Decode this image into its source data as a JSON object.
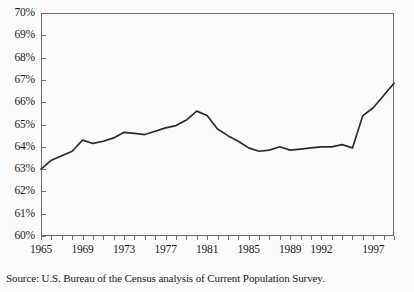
{
  "title_remnant": "",
  "source": {
    "text": "Source: U.S. Bureau of the Census analysis of Current Population Survey."
  },
  "axis": {
    "y_labels": [
      "70%",
      "69%",
      "68%",
      "67%",
      "66%",
      "65%",
      "64%",
      "63%",
      "62%",
      "61%",
      "60%"
    ],
    "x_labels": [
      "1965",
      "1969",
      "1973",
      "1977",
      "1981",
      "1985",
      "1989",
      "1992",
      "1997"
    ]
  },
  "style": {
    "line_color": "#2b2b2b",
    "frame_color": "#6f6f6f",
    "background": "#fbfbfb"
  },
  "chart_data": {
    "type": "line",
    "title": "",
    "xlabel": "",
    "ylabel": "",
    "ylim": [
      60,
      70
    ],
    "xlim": [
      1965,
      1999
    ],
    "ytick_values": [
      60,
      61,
      62,
      63,
      64,
      65,
      66,
      67,
      68,
      69,
      70
    ],
    "ytick_labels": [
      "60%",
      "61%",
      "62%",
      "63%",
      "64%",
      "65%",
      "66%",
      "67%",
      "68%",
      "69%",
      "70%"
    ],
    "xtick_values": [
      1965,
      1966,
      1967,
      1968,
      1969,
      1970,
      1971,
      1972,
      1973,
      1974,
      1975,
      1976,
      1977,
      1978,
      1979,
      1980,
      1981,
      1982,
      1983,
      1984,
      1985,
      1986,
      1987,
      1988,
      1989,
      1990,
      1991,
      1992,
      1993,
      1994,
      1995,
      1996,
      1997,
      1998,
      1999
    ],
    "xtick_labels_shown": [
      "1965",
      "1969",
      "1973",
      "1977",
      "1981",
      "1985",
      "1989",
      "1992",
      "1997"
    ],
    "xtick_labeled_values": [
      1965,
      1969,
      1973,
      1977,
      1981,
      1985,
      1989,
      1992,
      1997
    ],
    "grid": false,
    "legend": false,
    "units": "percent",
    "series": [
      {
        "name": "Share of households",
        "x": [
          1965,
          1966,
          1967,
          1968,
          1969,
          1970,
          1971,
          1972,
          1973,
          1974,
          1975,
          1976,
          1977,
          1978,
          1979,
          1980,
          1981,
          1982,
          1983,
          1984,
          1985,
          1986,
          1987,
          1988,
          1989,
          1990,
          1991,
          1992,
          1993,
          1994,
          1995,
          1996,
          1997,
          1998,
          1999
        ],
        "values": [
          63.0,
          63.4,
          63.6,
          63.8,
          64.3,
          64.15,
          64.25,
          64.4,
          64.65,
          64.6,
          64.55,
          64.7,
          64.85,
          64.95,
          65.2,
          65.6,
          65.4,
          64.8,
          64.5,
          64.25,
          63.95,
          63.8,
          63.85,
          64.0,
          63.85,
          63.9,
          63.95,
          64.0,
          64.0,
          64.1,
          63.95,
          65.4,
          65.75,
          66.3,
          66.85
        ]
      }
    ]
  }
}
